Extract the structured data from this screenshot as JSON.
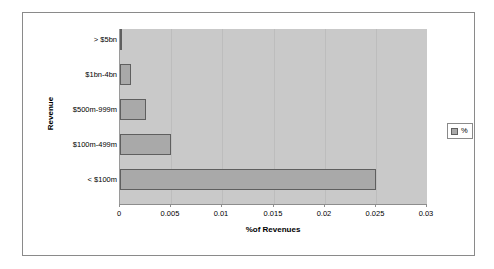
{
  "chart_data": {
    "type": "bar",
    "orientation": "horizontal",
    "title": "",
    "xlabel": "%of Revenues",
    "ylabel": "Revenue",
    "categories": [
      "> $5bn",
      "$1bn-4bn",
      "$500m-999m",
      "$100m-499m",
      "< $100m"
    ],
    "series": [
      {
        "name": "%",
        "values": [
          0.0001,
          0.0011,
          0.0025,
          0.005,
          0.025
        ]
      }
    ],
    "xlim": [
      0,
      0.03
    ],
    "xticks": [
      0,
      0.005,
      0.01,
      0.015,
      0.02,
      0.025,
      0.03
    ],
    "xtick_labels": [
      "0",
      "0.005",
      "0.01",
      "0.015",
      "0.02",
      "0.025",
      "0.03"
    ],
    "grid": true,
    "grid_axis": "x",
    "legend": {
      "position": "right",
      "entries": [
        {
          "label": "%",
          "swatch": "bar-swatch-icon"
        }
      ]
    },
    "colors": {
      "bar_fill": "#a9a9a9",
      "bar_border": "#5f5f5f",
      "plot_background": "#c9c9c9",
      "gridline": "#bdbdbd",
      "chart_background": "#ffffff",
      "frame_border": "#8a8a8a",
      "text": "#000000"
    }
  }
}
